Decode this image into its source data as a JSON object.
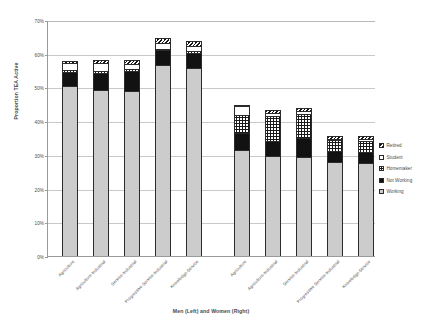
{
  "chart_data": {
    "type": "bar",
    "title": "",
    "subtitle": "",
    "stacked": true,
    "xlabel": "Men (Left) and Women (Right)",
    "ylabel": "Proportion TEA Active",
    "ylim": [
      0,
      70
    ],
    "yticks": [
      0,
      10,
      20,
      30,
      40,
      50,
      60,
      70
    ],
    "ytick_labels": [
      "0%",
      "10%",
      "20%",
      "30%",
      "40%",
      "50%",
      "60%",
      "70%"
    ],
    "grid": true,
    "legend_position": "right",
    "legend_entries": [
      "Retired",
      "Student",
      "Homemaker",
      "Not Working",
      "Working"
    ],
    "groups": [
      "Men (Left)",
      "Women (Right)"
    ],
    "categories": [
      "Agriculture",
      "Agriculture-Industrial",
      "Service-Industrial",
      "Progressive Service-Industrial",
      "Knowledge-Service"
    ],
    "series": [
      {
        "name": "Working",
        "pattern": "light-gray-stipple",
        "color": "#cccccc",
        "men": [
          50.3,
          49.2,
          49.0,
          56.7,
          55.8
        ],
        "women": [
          31.5,
          29.8,
          29.3,
          27.8,
          27.6
        ]
      },
      {
        "name": "Not Working",
        "pattern": "solid-black",
        "color": "#121212",
        "men": [
          4.2,
          5.2,
          6.0,
          4.3,
          4.4
        ],
        "women": [
          4.9,
          4.4,
          5.6,
          3.3,
          3.4
        ]
      },
      {
        "name": "Homemaker",
        "pattern": "dotted",
        "color": "#ffffff",
        "men": [
          0.7,
          0.6,
          0.5,
          0.5,
          0.5
        ],
        "women": [
          5.3,
          7.4,
          7.3,
          3.2,
          3.1
        ]
      },
      {
        "name": "Student",
        "pattern": "plain-white",
        "color": "#ffffff",
        "men": [
          2.1,
          2.3,
          1.5,
          1.6,
          1.6
        ],
        "women": [
          2.9,
          0.8,
          0.8,
          0.5,
          0.5
        ]
      },
      {
        "name": "Retired",
        "pattern": "diagonal-hatch",
        "color": "#ffffff",
        "men": [
          0.5,
          0.9,
          1.1,
          1.5,
          1.5
        ],
        "women": [
          0.2,
          1.0,
          1.0,
          0.9,
          0.9
        ]
      }
    ],
    "totals": {
      "men": [
        57.8,
        58.2,
        58.1,
        64.6,
        63.8
      ],
      "women": [
        44.8,
        43.4,
        44.0,
        35.7,
        35.5
      ]
    }
  },
  "axes": {
    "y_title": "Proportion TEA Active",
    "x_title": "Men (Left) and Women (Right)",
    "y_tick_labels": [
      "70%",
      "60%",
      "50%",
      "40%",
      "30%",
      "20%",
      "10%",
      "0%"
    ]
  },
  "legend": {
    "items": [
      {
        "label": "Retired",
        "pattern": "diagonal-hatch"
      },
      {
        "label": "Student",
        "pattern": "plain-white"
      },
      {
        "label": "Homemaker",
        "pattern": "dotted"
      },
      {
        "label": "Not Working",
        "pattern": "solid-black"
      },
      {
        "label": "Working",
        "pattern": "light-gray-stipple"
      }
    ]
  },
  "x_tick_labels": [
    "Agriculture",
    "Agriculture-Industrial",
    "Service-Industrial",
    "Progressive Service-Industrial",
    "Knowledge-Service",
    "Agriculture",
    "Agriculture-Industrial",
    "Service-Industrial",
    "Progressive Service-Industrial",
    "Knowledge-Service"
  ]
}
